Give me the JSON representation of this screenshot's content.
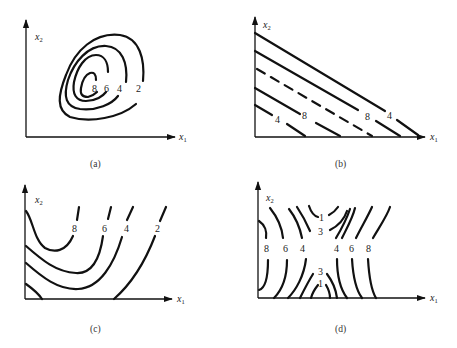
{
  "figure": {
    "panels": [
      {
        "id": "a",
        "caption": "(a)",
        "x_axis_label": "x",
        "x_axis_sub": "1",
        "y_axis_label": "x",
        "y_axis_sub": "2",
        "contour_labels": [
          "8",
          "6",
          "4",
          "2"
        ],
        "description": "Nested closed elliptical contours tilted along diagonal"
      },
      {
        "id": "b",
        "caption": "(b)",
        "x_axis_label": "x",
        "x_axis_sub": "1",
        "y_axis_label": "x",
        "y_axis_sub": "2",
        "contour_labels": [
          "4",
          "8",
          "8",
          "4"
        ],
        "description": "Parallel straight-line contours with negative slope; middle line dashed"
      },
      {
        "id": "c",
        "caption": "(c)",
        "x_axis_label": "x",
        "x_axis_sub": "1",
        "y_axis_label": "x",
        "y_axis_sub": "2",
        "contour_labels": [
          "8",
          "6",
          "4",
          "2"
        ],
        "description": "Curved U-shaped contours opening upward"
      },
      {
        "id": "d",
        "caption": "(d)",
        "x_axis_label": "x",
        "x_axis_sub": "1",
        "y_axis_label": "x",
        "y_axis_sub": "2",
        "contour_labels_left": [
          "8",
          "6",
          "4"
        ],
        "contour_labels_right": [
          "4",
          "6",
          "8"
        ],
        "contour_labels_top": [
          "1",
          "3"
        ],
        "contour_labels_bottom": [
          "3",
          "1"
        ],
        "description": "Saddle-point contours: hyperbolic curves"
      }
    ]
  }
}
